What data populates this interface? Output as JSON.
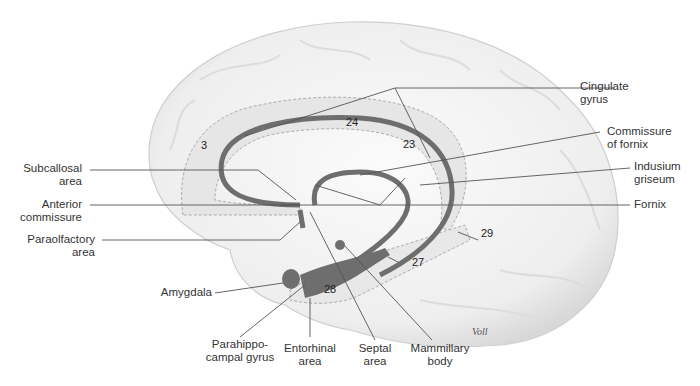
{
  "figure": {
    "signature": "Voll"
  },
  "labels": {
    "cingulate_gyrus": [
      "Cingulate",
      "gyrus"
    ],
    "commissure_of_fornix": [
      "Commissure",
      "of fornix"
    ],
    "indusium_griseum": [
      "Indusium",
      "griseum"
    ],
    "fornix": [
      "Fornix"
    ],
    "subcallosal_area": [
      "Subcallosal",
      "area"
    ],
    "anterior_commissure": [
      "Anterior",
      "commissure"
    ],
    "paraolfactory_area": [
      "Paraolfactory",
      "area"
    ],
    "amygdala": [
      "Amygdala"
    ],
    "parahippocampal_gyrus": [
      "Parahippo-",
      "campal gyrus"
    ],
    "entorhinal_area": [
      "Entorhinal",
      "area"
    ],
    "septal_area": [
      "Septal",
      "area"
    ],
    "mammillary_body": [
      "Mammillary",
      "body"
    ]
  },
  "area_numbers": {
    "a3": "3",
    "a24": "24",
    "a23": "23",
    "a29": "29",
    "a27": "27",
    "a28": "28"
  },
  "colors": {
    "structure": "#6e6e6e",
    "region_fill": "#e4e4e4",
    "brain_fill": "#f4f4f4",
    "leader_line": "#555555"
  }
}
